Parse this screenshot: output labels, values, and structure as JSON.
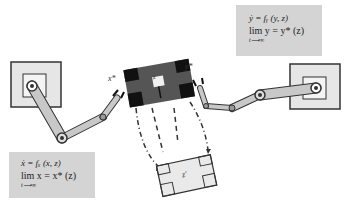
{
  "diagram": {
    "type": "dual-arm-manipulation",
    "object_label": "z",
    "target_label": "z'",
    "left_gripper_label": "x*",
    "right_gripper_label": "y*",
    "left_equations": {
      "line1": "ẋ = fₓ (x, z)",
      "line2": "lim x = x* (z)",
      "line3": "t⟶∞"
    },
    "right_equations": {
      "line1": "ẏ = fᵧ (y, z)",
      "line2": "lim y = y* (z)",
      "line3": "t⟶∞"
    },
    "colors": {
      "box": "#d4d4d4",
      "arm": "#c8c8c8",
      "object_dark": "#111111",
      "object_mid": "#555555",
      "outline": "#333333"
    }
  }
}
